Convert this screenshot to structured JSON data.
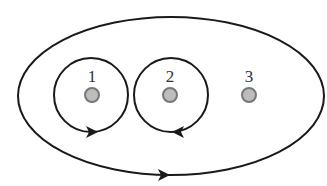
{
  "diagram": {
    "charges": [
      {
        "label": "1",
        "cx": 92,
        "cy": 95,
        "fill": "#bdbdbd",
        "stroke": "#777777"
      },
      {
        "label": "2",
        "cx": 170,
        "cy": 95,
        "fill": "#bdbdbd",
        "stroke": "#777777"
      },
      {
        "label": "3",
        "cx": 249,
        "cy": 95,
        "fill": "#bdbdbd",
        "stroke": "#777777"
      }
    ],
    "loops": [
      {
        "name": "loop-around-1",
        "direction": "counterclockwise"
      },
      {
        "name": "loop-around-2",
        "direction": "clockwise"
      },
      {
        "name": "outer-loop-around-all",
        "direction": "counterclockwise"
      }
    ],
    "colors": {
      "line": "#1a1a1a",
      "charge_fill": "#bdbdbd",
      "charge_stroke": "#777777",
      "label": "#333333"
    }
  }
}
